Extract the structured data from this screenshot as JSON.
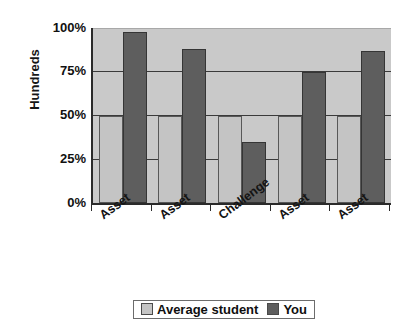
{
  "chart_data": {
    "type": "bar",
    "title": "",
    "xlabel": "",
    "ylabel": "Hundreds",
    "categories": [
      "Asset",
      "Asset",
      "Challenge",
      "Asset",
      "Asset"
    ],
    "series": [
      {
        "name": "Average student",
        "color": "#c4c4c4",
        "values": [
          50,
          50,
          50,
          50,
          50
        ]
      },
      {
        "name": "You",
        "color": "#5e5e5e",
        "values": [
          98,
          88,
          35,
          75,
          87
        ]
      }
    ],
    "ylim": [
      0,
      100
    ],
    "ytick_labels": [
      "100%",
      "75%",
      "50%",
      "25%",
      "0%"
    ],
    "ytick_values": [
      100,
      75,
      50,
      25,
      0
    ],
    "grid": true,
    "legend_position": "bottom",
    "plot_background": "#c9c9c9"
  },
  "legend": {
    "items": [
      {
        "label": "Average student",
        "swatch": "#c4c4c4"
      },
      {
        "label": "You",
        "swatch": "#5e5e5e"
      }
    ]
  }
}
